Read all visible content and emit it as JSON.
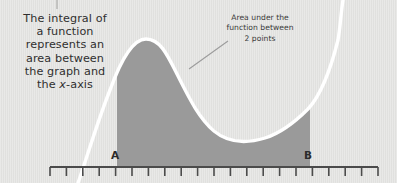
{
  "figure": {
    "title_caption": {
      "line1": "The integral of",
      "line2": "a function",
      "line3": "represents an",
      "line4": "area between",
      "line5": "the graph and",
      "line6_prefix": "the ",
      "line6_var": "x",
      "line6_suffix": "-axis"
    },
    "annotation": {
      "line1": "Area under the",
      "line2": "function between",
      "line3": "2 points"
    },
    "axis_labels": {
      "lower_bound": "A",
      "upper_bound": "B"
    },
    "colors": {
      "background": "#e3e3e1",
      "shaded_area": "#9a9a9a",
      "curve": "#ffffff",
      "axis": "#4b4b4b",
      "text": "#2f2f2f",
      "leader_line": "#9c9c9c"
    },
    "geometry": {
      "axis_y": 167,
      "axis_x_start": 50,
      "axis_x_end": 378,
      "tick_count": 21,
      "tick_spacing": 16.4,
      "tick_length": 8,
      "bound_a_x": 117,
      "bound_b_x": 310,
      "peak_x": 145,
      "peak_y": 38,
      "valley_x": 273,
      "valley_y": 137
    }
  }
}
